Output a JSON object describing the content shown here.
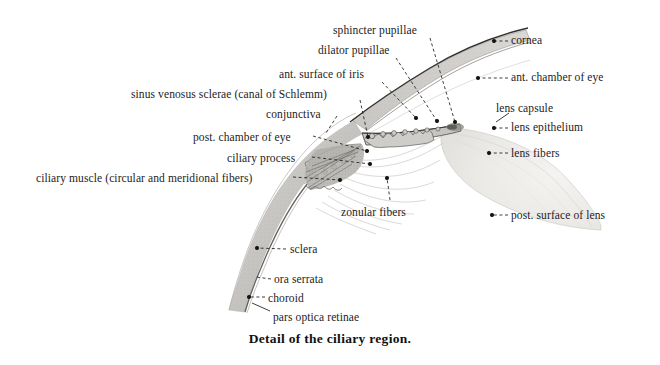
{
  "figure": {
    "caption": "Detail of the ciliary region.",
    "background_color": "#ffffff",
    "ink_color": "#1c1c1c",
    "tissue_fill": "#cfcdc9",
    "lens_fill": "#ededeb",
    "iris_fill": "#c9c7c3"
  },
  "labels": [
    {
      "id": "sphincter-pupillae",
      "text": "sphincter pupillae",
      "x": 333,
      "y": 24,
      "align": "left",
      "leader": {
        "from_x": 430,
        "from_y": 38,
        "to_x": 455,
        "to_y": 122,
        "style": "dashed",
        "dot": true
      }
    },
    {
      "id": "dilator-pupillae",
      "text": "dilator pupillae",
      "x": 318,
      "y": 44,
      "align": "left",
      "leader": {
        "from_x": 396,
        "from_y": 58,
        "to_x": 437,
        "to_y": 121,
        "style": "dashed",
        "dot": true
      }
    },
    {
      "id": "ant-surface-of-iris",
      "text": "ant. surface of iris",
      "x": 279,
      "y": 68,
      "align": "left",
      "leader": {
        "from_x": 382,
        "from_y": 82,
        "to_x": 416,
        "to_y": 118,
        "style": "dashed",
        "dot": true
      }
    },
    {
      "id": "sinus-venosus-sclerae",
      "text": "sinus venosus sclerae (canal of Schlemm)",
      "x": 131,
      "y": 88,
      "align": "left",
      "leader": {
        "from_x": 360,
        "from_y": 100,
        "to_x": 368,
        "to_y": 137,
        "style": "dashed",
        "dot": true
      }
    },
    {
      "id": "conjunctiva",
      "text": "conjunctiva",
      "x": 266,
      "y": 108,
      "align": "left",
      "leader": {
        "from_x": 337,
        "from_y": 116,
        "to_x": 326,
        "to_y": 133,
        "style": "dashed",
        "dot": false
      }
    },
    {
      "id": "post-chamber-of-eye",
      "text": "post. chamber of eye",
      "x": 193,
      "y": 131,
      "align": "left",
      "leader": {
        "from_x": 313,
        "from_y": 136,
        "to_x": 367,
        "to_y": 151,
        "style": "dashed",
        "dot": true
      }
    },
    {
      "id": "ciliary-process",
      "text": "ciliary process",
      "x": 227,
      "y": 152,
      "align": "left",
      "leader": {
        "from_x": 312,
        "from_y": 157,
        "to_x": 370,
        "to_y": 164,
        "style": "dashed",
        "dot": true
      }
    },
    {
      "id": "ciliary-muscle",
      "text": "ciliary muscle (circular and meridional fibers)",
      "x": 36,
      "y": 172,
      "align": "left",
      "leader": {
        "from_x": 293,
        "from_y": 177,
        "to_x": 340,
        "to_y": 180,
        "style": "dashed",
        "dot": true
      }
    },
    {
      "id": "zonular-fibers",
      "text": "zonular fibers",
      "x": 341,
      "y": 206,
      "align": "left",
      "leader": {
        "from_x": 390,
        "from_y": 200,
        "to_x": 387,
        "to_y": 178,
        "style": "dashed",
        "dot": true
      }
    },
    {
      "id": "sclera",
      "text": "sclera",
      "x": 290,
      "y": 243,
      "align": "left",
      "leader": {
        "from_x": 286,
        "from_y": 249,
        "to_x": 257,
        "to_y": 248,
        "style": "dashed",
        "dot": true
      }
    },
    {
      "id": "ora-serrata",
      "text": "ora serrata",
      "x": 274,
      "y": 273,
      "align": "left",
      "leader": {
        "from_x": 271,
        "from_y": 279,
        "to_x": 256,
        "to_y": 277,
        "style": "dashed",
        "dot": false
      }
    },
    {
      "id": "choroid",
      "text": "choroid",
      "x": 268,
      "y": 292,
      "align": "left",
      "leader": {
        "from_x": 265,
        "from_y": 297,
        "to_x": 249,
        "to_y": 297,
        "style": "dashed",
        "dot": true
      }
    },
    {
      "id": "pars-optica-retinae",
      "text": "pars optica retinae",
      "x": 273,
      "y": 311,
      "align": "left",
      "leader": {
        "from_x": 270,
        "from_y": 311,
        "to_x": 252,
        "to_y": 303,
        "style": "solid",
        "dot": false
      }
    },
    {
      "id": "cornea",
      "text": "cornea",
      "x": 511,
      "y": 34,
      "align": "left",
      "leader": {
        "from_x": 508,
        "from_y": 41,
        "to_x": 494,
        "to_y": 41,
        "style": "dashed",
        "dot": true
      }
    },
    {
      "id": "ant-chamber-of-eye",
      "text": "ant. chamber of eye",
      "x": 511,
      "y": 71,
      "align": "left",
      "leader": {
        "from_x": 508,
        "from_y": 78,
        "to_x": 478,
        "to_y": 78,
        "style": "dashed",
        "dot": true
      }
    },
    {
      "id": "lens-capsule",
      "text": "lens capsule",
      "x": 496,
      "y": 102,
      "align": "left",
      "leader": {
        "from_x": 509,
        "from_y": 113,
        "to_x": 496,
        "to_y": 122,
        "style": "solid",
        "dot": false
      }
    },
    {
      "id": "lens-epithelium",
      "text": "lens epithelium",
      "x": 511,
      "y": 121,
      "align": "left",
      "leader": {
        "from_x": 508,
        "from_y": 128,
        "to_x": 494,
        "to_y": 128,
        "style": "dashed",
        "dot": true
      }
    },
    {
      "id": "lens-fibers",
      "text": "lens fibers",
      "x": 511,
      "y": 147,
      "align": "left",
      "leader": {
        "from_x": 508,
        "from_y": 153,
        "to_x": 489,
        "to_y": 153,
        "style": "dashed",
        "dot": true
      }
    },
    {
      "id": "post-surface-of-lens",
      "text": "post. surface of lens",
      "x": 511,
      "y": 209,
      "align": "left",
      "leader": {
        "from_x": 508,
        "from_y": 215,
        "to_x": 492,
        "to_y": 215,
        "style": "dashed",
        "dot": true
      }
    }
  ]
}
